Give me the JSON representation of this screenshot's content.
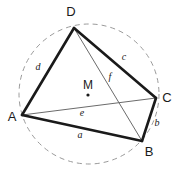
{
  "figure": {
    "background_color": "#ffffff",
    "width": 182,
    "height": 177,
    "stroke_color_thick": "#1a1a1a",
    "stroke_color_thin": "#6b6b6b",
    "circle_color": "#9a9a9a",
    "label_color": "#1a1a1a"
  },
  "circle": {
    "name": "circumcircle",
    "center_x": 89,
    "center_y": 94,
    "radius": 70,
    "style": "dashed",
    "dash_pattern": "5 4",
    "stroke_width": 1
  },
  "center_point": {
    "label": "M",
    "label_x": 88,
    "label_y": 86,
    "dot_x": 88,
    "dot_y": 95,
    "dot_radius": 1.6
  },
  "vertices": [
    {
      "id": "A",
      "label": "A",
      "x": 22,
      "y": 115,
      "label_x": 12,
      "label_y": 118
    },
    {
      "id": "B",
      "label": "B",
      "x": 142,
      "y": 141,
      "label_x": 149,
      "label_y": 153
    },
    {
      "id": "C",
      "label": "C",
      "x": 156,
      "y": 98,
      "label_x": 167,
      "label_y": 99
    },
    {
      "id": "D",
      "label": "D",
      "x": 74,
      "y": 28,
      "label_x": 71,
      "label_y": 13
    }
  ],
  "sides": [
    {
      "id": "a",
      "label": "a",
      "from": "A",
      "to": "B",
      "x1": 22,
      "y1": 115,
      "x2": 142,
      "y2": 141,
      "label_x": 80,
      "label_y": 136,
      "stroke_width": 2.6
    },
    {
      "id": "b",
      "label": "b",
      "from": "B",
      "to": "C",
      "x1": 142,
      "y1": 141,
      "x2": 156,
      "y2": 98,
      "label_x": 157,
      "label_y": 124,
      "stroke_width": 2.6
    },
    {
      "id": "c",
      "label": "c",
      "from": "C",
      "to": "D",
      "x1": 156,
      "y1": 98,
      "x2": 74,
      "y2": 28,
      "label_x": 124,
      "label_y": 58,
      "stroke_width": 2.6
    },
    {
      "id": "d",
      "label": "d",
      "from": "D",
      "to": "A",
      "x1": 74,
      "y1": 28,
      "x2": 22,
      "y2": 115,
      "label_x": 38,
      "label_y": 68,
      "stroke_width": 2.6
    }
  ],
  "diagonals": [
    {
      "id": "e",
      "label": "e",
      "from": "A",
      "to": "C",
      "x1": 22,
      "y1": 115,
      "x2": 156,
      "y2": 98,
      "label_x": 82,
      "label_y": 114,
      "stroke_width": 1
    },
    {
      "id": "f",
      "label": "f",
      "from": "D",
      "to": "B",
      "x1": 74,
      "y1": 28,
      "x2": 142,
      "y2": 141,
      "label_x": 110,
      "label_y": 78,
      "stroke_width": 1
    }
  ]
}
